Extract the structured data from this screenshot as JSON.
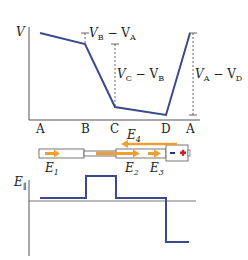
{
  "colors": {
    "curve": "#3a4a8c",
    "axis": "#555555",
    "arrow": "#f0a030",
    "battery_minus": "#1a3a8a",
    "battery_plus": "#cc2020"
  },
  "potential_graph": {
    "y_axis_label": "V",
    "x_labels": [
      "A",
      "B",
      "C",
      "D",
      "A"
    ],
    "annotations": [
      {
        "main": "V",
        "sub1": "B",
        "minus": " − V",
        "sub2": "A"
      },
      {
        "main": "V",
        "sub1": "C",
        "minus": " − V",
        "sub2": "B"
      },
      {
        "main": "V",
        "sub1": "A",
        "minus": " − V",
        "sub2": "D"
      }
    ]
  },
  "circuit": {
    "field_labels": [
      {
        "main": "E",
        "sub": "1"
      },
      {
        "main": "E",
        "sub": "2"
      },
      {
        "main": "E",
        "sub": "3"
      },
      {
        "main": "E",
        "sub": "4"
      }
    ],
    "battery": {
      "minus": "−",
      "plus": "+"
    }
  },
  "field_graph": {
    "y_axis_label": {
      "main": "E",
      "sub": "∥"
    }
  }
}
